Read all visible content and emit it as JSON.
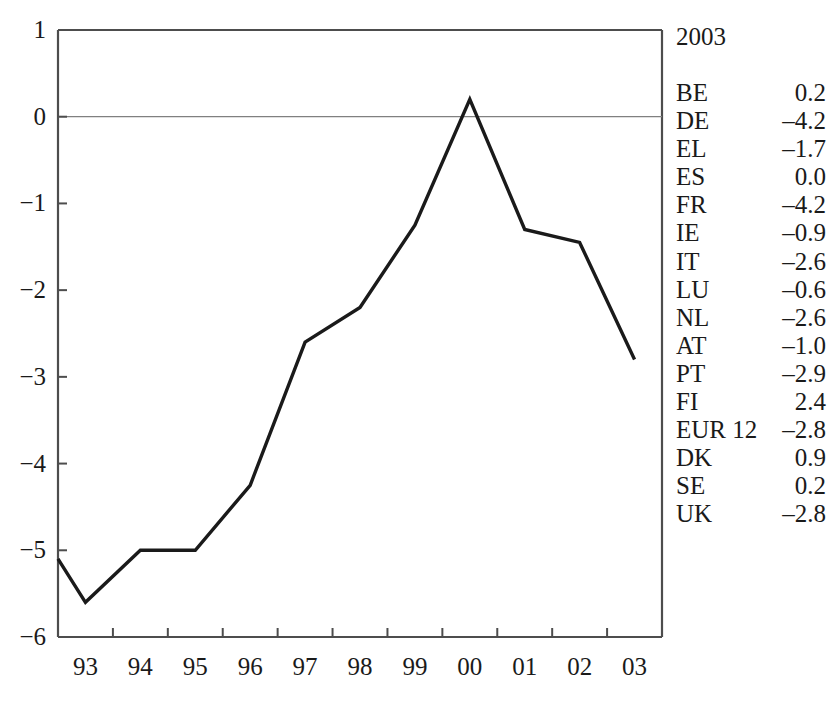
{
  "chart_data": {
    "type": "line",
    "title": "",
    "xlabel": "",
    "ylabel": "",
    "categories": [
      "93",
      "94",
      "95",
      "96",
      "97",
      "98",
      "99",
      "00",
      "01",
      "02",
      "03"
    ],
    "values": [
      -5.6,
      -5.0,
      -5.0,
      -4.25,
      -2.6,
      -2.2,
      -1.25,
      0.2,
      -1.3,
      -1.45,
      -2.8
    ],
    "series": [
      {
        "name": "",
        "values": [
          -5.6,
          -5.0,
          -5.0,
          -4.25,
          -2.6,
          -2.2,
          -1.25,
          0.2,
          -1.3,
          -1.45,
          -2.8
        ]
      }
    ],
    "ylim": [
      -6,
      1
    ],
    "yticks": [
      1,
      0,
      -1,
      -2,
      -3,
      -4,
      -5,
      -6
    ],
    "ytick_labels": [
      "1",
      "0",
      "−1",
      "−2",
      "−3",
      "−4",
      "−5",
      "−6"
    ],
    "xtick_labels": [
      "93",
      "94",
      "95",
      "96",
      "97",
      "98",
      "99",
      "00",
      "01",
      "02",
      "03"
    ],
    "grid": false,
    "zero_line": true,
    "legend_position": "right",
    "line_color": "#1a1a1a",
    "axis_color": "#4d4d4d",
    "zero_line_color": "#808080"
  },
  "legend": {
    "title": "2003",
    "rows": [
      {
        "name": "BE",
        "value": "0.2"
      },
      {
        "name": "DE",
        "value": "–4.2"
      },
      {
        "name": "EL",
        "value": "–1.7"
      },
      {
        "name": "ES",
        "value": "0.0"
      },
      {
        "name": "FR",
        "value": "–4.2"
      },
      {
        "name": "IE",
        "value": "–0.9"
      },
      {
        "name": "IT",
        "value": "–2.6"
      },
      {
        "name": "LU",
        "value": "–0.6"
      },
      {
        "name": "NL",
        "value": "–2.6"
      },
      {
        "name": "AT",
        "value": "–1.0"
      },
      {
        "name": "PT",
        "value": "–2.9"
      },
      {
        "name": "FI",
        "value": "2.4"
      },
      {
        "name": "EUR 12",
        "value": "–2.8"
      },
      {
        "name": "DK",
        "value": "0.9"
      },
      {
        "name": "SE",
        "value": "0.2"
      },
      {
        "name": "UK",
        "value": "–2.8"
      }
    ]
  }
}
